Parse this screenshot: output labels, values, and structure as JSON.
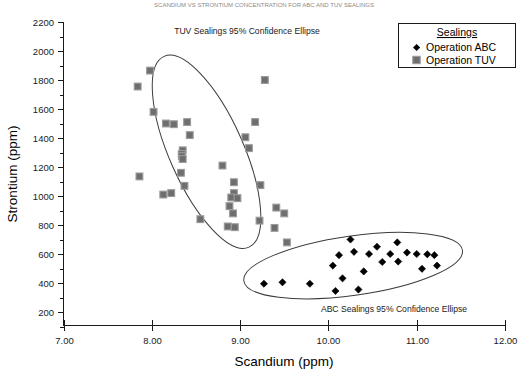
{
  "top_title": "SCANDIUM VS STRONTIUM CONCENTRATION FOR ABC AND TUV SEALINGS",
  "chart_data": {
    "type": "scatter",
    "title": "",
    "xlabel": "Scandium (ppm)",
    "ylabel": "Strontium (ppm)",
    "xlim": [
      7.0,
      12.0
    ],
    "ylim": [
      100,
      2250
    ],
    "xticks": [
      "7.00",
      "8.00",
      "9.00",
      "10.00",
      "11.00",
      "12.00"
    ],
    "xtick_values": [
      7,
      8,
      9,
      10,
      11,
      12
    ],
    "yticks": [
      "200",
      "400",
      "600",
      "800",
      "1000",
      "1200",
      "1400",
      "1600",
      "1800",
      "2000",
      "2200"
    ],
    "ytick_values": [
      200,
      400,
      600,
      800,
      1000,
      1200,
      1400,
      1600,
      1800,
      2000,
      2200
    ],
    "y_minor_step": 100,
    "grid": false,
    "legend_position": "top-right",
    "legend_title": "Sealings",
    "series": [
      {
        "name": "Operation ABC",
        "marker": "diamond",
        "color": "#000000",
        "points": [
          [
            9.27,
            395
          ],
          [
            9.48,
            405
          ],
          [
            9.79,
            395
          ],
          [
            10.08,
            345
          ],
          [
            10.05,
            520
          ],
          [
            10.16,
            432
          ],
          [
            10.12,
            592
          ],
          [
            10.25,
            700
          ],
          [
            10.29,
            615
          ],
          [
            10.34,
            355
          ],
          [
            10.46,
            600
          ],
          [
            10.4,
            480
          ],
          [
            10.55,
            650
          ],
          [
            10.61,
            545
          ],
          [
            10.7,
            600
          ],
          [
            10.78,
            680
          ],
          [
            10.79,
            548
          ],
          [
            10.89,
            610
          ],
          [
            11.0,
            600
          ],
          [
            11.06,
            498
          ],
          [
            11.12,
            598
          ],
          [
            11.2,
            592
          ],
          [
            11.23,
            520
          ]
        ]
      },
      {
        "name": "Operation TUV",
        "marker": "square",
        "color": "#6e6e6e",
        "points": [
          [
            7.98,
            1865
          ],
          [
            7.84,
            1755
          ],
          [
            8.02,
            1580
          ],
          [
            8.16,
            1500
          ],
          [
            8.25,
            1495
          ],
          [
            8.4,
            1510
          ],
          [
            8.43,
            1420
          ],
          [
            8.35,
            1315
          ],
          [
            8.34,
            1290
          ],
          [
            8.34,
            1275
          ],
          [
            8.35,
            1255
          ],
          [
            8.33,
            1160
          ],
          [
            8.37,
            1070
          ],
          [
            8.13,
            1010
          ],
          [
            8.22,
            1020
          ],
          [
            7.86,
            1135
          ],
          [
            8.55,
            840
          ],
          [
            8.8,
            1210
          ],
          [
            8.93,
            1095
          ],
          [
            8.93,
            1020
          ],
          [
            8.9,
            990
          ],
          [
            8.97,
            985
          ],
          [
            8.88,
            930
          ],
          [
            8.92,
            880
          ],
          [
            8.86,
            790
          ],
          [
            8.94,
            785
          ],
          [
            9.28,
            1800
          ],
          [
            9.17,
            1510
          ],
          [
            9.06,
            1405
          ],
          [
            9.1,
            1330
          ],
          [
            9.23,
            1075
          ],
          [
            9.41,
            920
          ],
          [
            9.22,
            830
          ],
          [
            9.5,
            880
          ],
          [
            9.39,
            780
          ],
          [
            9.53,
            680
          ]
        ]
      }
    ],
    "annotations": [
      {
        "text": "TUV Sealings 95% Confidence Ellipse",
        "x": 8.55,
        "y": 2180
      },
      {
        "text": "ABC Sealings 95% Confidence Ellipse",
        "x": 10.8,
        "y": 235
      }
    ],
    "ellipses": [
      {
        "label": "TUV Sealings 95% Confidence Ellipse",
        "cx": 8.62,
        "cy": 1305,
        "rx": 255,
        "ry": 720,
        "rotation": -24
      },
      {
        "label": "ABC Sealings 95% Confidence Ellipse",
        "cx": 10.28,
        "cy": 520,
        "rx": 1.25,
        "ry": 205,
        "rotation": -8
      }
    ]
  }
}
